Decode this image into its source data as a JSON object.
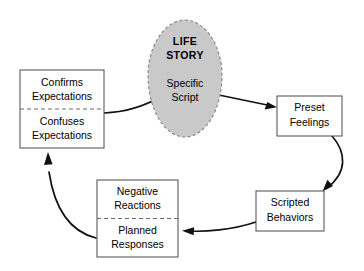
{
  "diagram": {
    "core": {
      "name": "core-shape",
      "shape": "egg",
      "fill": "#c9c9c9",
      "border": "#8a8a8a",
      "border_style": "dashed",
      "title_line1": "LIFE",
      "title_line2": "STORY",
      "sub_line1": "Specific",
      "sub_line2": "Script"
    },
    "nodes": [
      {
        "id": "expectations",
        "name": "expectations-box",
        "split": true,
        "top_line1": "Confirms",
        "top_line2": "Expectations",
        "bottom_line1": "Confuses",
        "bottom_line2": "Expectations"
      },
      {
        "id": "preset-feelings",
        "name": "preset-feelings-box",
        "split": false,
        "line1": "Preset",
        "line2": "Feelings"
      },
      {
        "id": "scripted-behaviors",
        "name": "scripted-behaviors-box",
        "split": false,
        "line1": "Scripted",
        "line2": "Behaviors"
      },
      {
        "id": "reactions",
        "name": "reactions-box",
        "split": true,
        "top_line1": "Negative",
        "top_line2": "Reactions",
        "bottom_line1": "Planned",
        "bottom_line2": "Responses"
      }
    ],
    "connectors": [
      {
        "id": "expectations-to-core",
        "name": "connector-expectations-to-core",
        "arrowhead": false
      },
      {
        "id": "core-to-preset",
        "name": "connector-core-to-preset-feelings",
        "arrowhead": true
      },
      {
        "id": "preset-to-scripted",
        "name": "connector-preset-to-scripted",
        "arrowhead": true
      },
      {
        "id": "scripted-to-reactions",
        "name": "connector-scripted-to-reactions",
        "arrowhead": true
      },
      {
        "id": "reactions-to-expectations",
        "name": "connector-reactions-to-expectations",
        "arrowhead": true
      }
    ],
    "colors": {
      "line": "#111111",
      "box_border": "#4a4a4a",
      "core_fill": "#c9c9c9",
      "background": "#ffffff"
    }
  }
}
